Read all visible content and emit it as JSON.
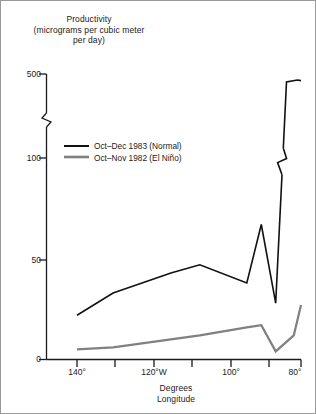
{
  "chart_data": {
    "type": "line",
    "title": "Productivity\n(micrograms per cubic meter\nper day)",
    "ylabel": "Productivity (micrograms per cubic meter per day)",
    "xlabel": "Degrees\nLongitude",
    "grid": false,
    "legend_position": "upper-left-inside",
    "y_axis_break": {
      "between": [
        100,
        500
      ],
      "style": "zigzag"
    },
    "yticks": [
      0,
      50,
      100,
      500
    ],
    "ytick_labels": [
      "0",
      "50",
      "100",
      "500"
    ],
    "ylim": [
      0,
      500
    ],
    "xticks": [
      140,
      130,
      120,
      110,
      100,
      90,
      80
    ],
    "xtick_labels": [
      "140°",
      "",
      "120°W",
      "",
      "100°",
      "",
      "80°"
    ],
    "xlim": [
      145,
      78
    ],
    "x_note": "degrees west longitude, decreasing left to right",
    "series": [
      {
        "name": "Oct–Dec 1983 (Normal)",
        "color": "#111111",
        "width": 1.6,
        "x": [
          142,
          132,
          124,
          116,
          108,
          95,
          91,
          87,
          84,
          81,
          80
        ],
        "y": [
          22,
          33,
          38,
          43,
          47,
          38,
          67,
          28,
          440,
          455,
          450
        ]
      },
      {
        "name": "Oct–Nov 1982 (El Niño)",
        "color": "#808080",
        "width": 2.2,
        "x": [
          142,
          132,
          124,
          116,
          108,
          95,
          91,
          87,
          82,
          80
        ],
        "y": [
          5,
          6,
          8,
          10,
          12,
          16,
          17,
          4,
          12,
          27
        ]
      }
    ]
  },
  "legend": {
    "items": [
      {
        "label": "Oct–Dec 1983 (Normal)",
        "color": "#111111"
      },
      {
        "label": "Oct–Nov 1982 (El Niño)",
        "color": "#808080"
      }
    ]
  },
  "axes": {
    "y_title": "Productivity\n(micrograms per cubic meter\nper day)",
    "x_title": "Degrees\nLongitude",
    "y_labels": {
      "t0": "0",
      "t50": "50",
      "t100": "100",
      "t500": "500"
    },
    "x_labels": {
      "t140": "140°",
      "t120": "120°W",
      "t100": "100°",
      "t80": "80°"
    }
  }
}
